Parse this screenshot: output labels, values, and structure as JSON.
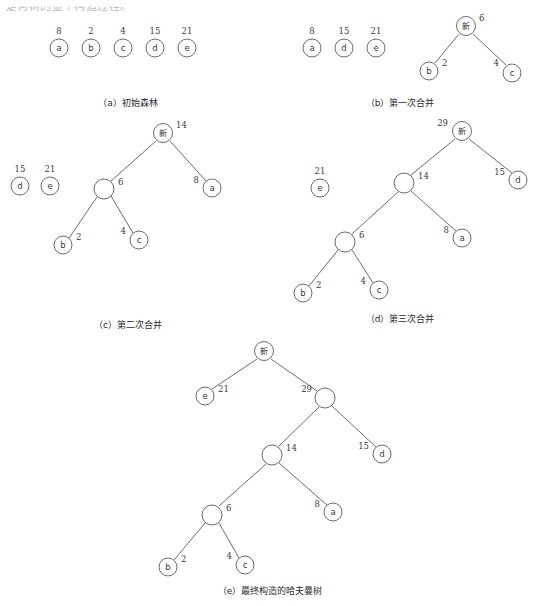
{
  "page": {
    "top_partial_text": "是何树的显个构造过程。",
    "width": 541,
    "height": 606,
    "background": "#ffffff",
    "ink_color": "#5a5a5a",
    "merge_node_label": "新"
  },
  "figure": {
    "type": "huffman-tree-construction",
    "leaf_weights": {
      "a": 8,
      "b": 2,
      "c": 4,
      "d": 15,
      "e": 21
    },
    "internal_weights": [
      6,
      14,
      29,
      50
    ]
  },
  "panels": [
    {
      "id": "a",
      "caption": "（a）初始森林",
      "caption_x": 128,
      "caption_y": 106,
      "nodes": [
        {
          "name": "a",
          "weight": "8",
          "cx": 59,
          "cy": 48,
          "r": 9,
          "is_merge": false,
          "wx": 59,
          "wy": 34,
          "w_anchor": "middle"
        },
        {
          "name": "b",
          "weight": "2",
          "cx": 91,
          "cy": 48,
          "r": 9,
          "is_merge": false,
          "wx": 91,
          "wy": 34,
          "w_anchor": "middle"
        },
        {
          "name": "c",
          "weight": "4",
          "cx": 123,
          "cy": 48,
          "r": 9,
          "is_merge": false,
          "wx": 123,
          "wy": 34,
          "w_anchor": "middle"
        },
        {
          "name": "d",
          "weight": "15",
          "cx": 155,
          "cy": 48,
          "r": 9,
          "is_merge": false,
          "wx": 155,
          "wy": 34,
          "w_anchor": "middle"
        },
        {
          "name": "e",
          "weight": "21",
          "cx": 187,
          "cy": 48,
          "r": 9,
          "is_merge": false,
          "wx": 187,
          "wy": 34,
          "w_anchor": "middle"
        }
      ],
      "edges": []
    },
    {
      "id": "b",
      "caption": "（b）第一次合并",
      "caption_x": 400,
      "caption_y": 106,
      "nodes": [
        {
          "name": "a",
          "weight": "8",
          "cx": 312,
          "cy": 48,
          "r": 9,
          "is_merge": false,
          "wx": 312,
          "wy": 34,
          "w_anchor": "middle"
        },
        {
          "name": "d",
          "weight": "15",
          "cx": 344,
          "cy": 48,
          "r": 9,
          "is_merge": false,
          "wx": 344,
          "wy": 34,
          "w_anchor": "middle"
        },
        {
          "name": "e",
          "weight": "21",
          "cx": 376,
          "cy": 48,
          "r": 9,
          "is_merge": false,
          "wx": 376,
          "wy": 34,
          "w_anchor": "middle"
        },
        {
          "name": "新",
          "weight": "6",
          "cx": 466,
          "cy": 26,
          "r": 9.5,
          "is_merge": true,
          "wx": 479,
          "wy": 21,
          "w_anchor": "start"
        },
        {
          "name": "b",
          "weight": "2",
          "cx": 429,
          "cy": 71,
          "r": 9,
          "is_merge": false,
          "wx": 442,
          "wy": 66,
          "w_anchor": "start"
        },
        {
          "name": "c",
          "weight": "4",
          "cx": 512,
          "cy": 73,
          "r": 9,
          "is_merge": false,
          "wx": 499,
          "wy": 66,
          "w_anchor": "end"
        }
      ],
      "edges": [
        {
          "x1": 459,
          "y1": 34,
          "x2": 435,
          "y2": 63
        },
        {
          "x1": 473,
          "y1": 34,
          "x2": 506,
          "y2": 65
        }
      ]
    },
    {
      "id": "c",
      "caption": "（c）第二次合并",
      "caption_x": 128,
      "caption_y": 328,
      "nodes": [
        {
          "name": "d",
          "weight": "15",
          "cx": 20,
          "cy": 186,
          "r": 9,
          "is_merge": false,
          "wx": 20,
          "wy": 172,
          "w_anchor": "middle"
        },
        {
          "name": "e",
          "weight": "21",
          "cx": 50,
          "cy": 186,
          "r": 9,
          "is_merge": false,
          "wx": 50,
          "wy": 172,
          "w_anchor": "middle"
        },
        {
          "name": "新",
          "weight": "14",
          "cx": 163,
          "cy": 133,
          "r": 9.5,
          "is_merge": true,
          "wx": 176,
          "wy": 128,
          "w_anchor": "start"
        },
        {
          "name": "",
          "weight": "6",
          "cx": 104,
          "cy": 189,
          "r": 10,
          "is_merge": false,
          "wx": 118,
          "wy": 185,
          "w_anchor": "start"
        },
        {
          "name": "a",
          "weight": "8",
          "cx": 212,
          "cy": 188,
          "r": 9,
          "is_merge": false,
          "wx": 199,
          "wy": 183,
          "w_anchor": "end"
        },
        {
          "name": "b",
          "weight": "2",
          "cx": 63,
          "cy": 245,
          "r": 9,
          "is_merge": false,
          "wx": 76,
          "wy": 240,
          "w_anchor": "start"
        },
        {
          "name": "c",
          "weight": "4",
          "cx": 139,
          "cy": 240,
          "r": 9,
          "is_merge": false,
          "wx": 126,
          "wy": 234,
          "w_anchor": "end"
        }
      ],
      "edges": [
        {
          "x1": 156,
          "y1": 141,
          "x2": 111,
          "y2": 181
        },
        {
          "x1": 170,
          "y1": 141,
          "x2": 206,
          "y2": 181
        },
        {
          "x1": 97,
          "y1": 197,
          "x2": 69,
          "y2": 238
        },
        {
          "x1": 111,
          "y1": 196,
          "x2": 133,
          "y2": 233
        }
      ]
    },
    {
      "id": "d",
      "caption": "（d）第三次合并",
      "caption_x": 400,
      "caption_y": 322,
      "nodes": [
        {
          "name": "e",
          "weight": "21",
          "cx": 320,
          "cy": 188,
          "r": 9,
          "is_merge": false,
          "wx": 320,
          "wy": 174,
          "w_anchor": "middle"
        },
        {
          "name": "新",
          "weight": "29",
          "cx": 462,
          "cy": 131,
          "r": 9.5,
          "is_merge": true,
          "wx": 448,
          "wy": 126,
          "w_anchor": "end"
        },
        {
          "name": "",
          "weight": "14",
          "cx": 404,
          "cy": 183,
          "r": 10,
          "is_merge": false,
          "wx": 418,
          "wy": 179,
          "w_anchor": "start"
        },
        {
          "name": "d",
          "weight": "15",
          "cx": 518,
          "cy": 180,
          "r": 9,
          "is_merge": false,
          "wx": 505,
          "wy": 175,
          "w_anchor": "end"
        },
        {
          "name": "",
          "weight": "6",
          "cx": 345,
          "cy": 242,
          "r": 10,
          "is_merge": false,
          "wx": 359,
          "wy": 238,
          "w_anchor": "start"
        },
        {
          "name": "a",
          "weight": "8",
          "cx": 462,
          "cy": 238,
          "r": 9,
          "is_merge": false,
          "wx": 449,
          "wy": 233,
          "w_anchor": "end"
        },
        {
          "name": "b",
          "weight": "2",
          "cx": 303,
          "cy": 293,
          "r": 9,
          "is_merge": false,
          "wx": 316,
          "wy": 288,
          "w_anchor": "start"
        },
        {
          "name": "c",
          "weight": "4",
          "cx": 379,
          "cy": 290,
          "r": 9,
          "is_merge": false,
          "wx": 366,
          "wy": 284,
          "w_anchor": "end"
        }
      ],
      "edges": [
        {
          "x1": 455,
          "y1": 139,
          "x2": 411,
          "y2": 175
        },
        {
          "x1": 469,
          "y1": 139,
          "x2": 512,
          "y2": 173
        },
        {
          "x1": 398,
          "y1": 192,
          "x2": 352,
          "y2": 234
        },
        {
          "x1": 411,
          "y1": 191,
          "x2": 456,
          "y2": 231
        },
        {
          "x1": 338,
          "y1": 250,
          "x2": 309,
          "y2": 286
        },
        {
          "x1": 352,
          "y1": 250,
          "x2": 373,
          "y2": 283
        }
      ]
    },
    {
      "id": "e",
      "caption": "（e）最终构造的哈夫曼树",
      "caption_x": 270,
      "caption_y": 594,
      "nodes": [
        {
          "name": "新",
          "weight": "",
          "cx": 264,
          "cy": 351,
          "r": 9.5,
          "is_merge": true,
          "wx": 264,
          "wy": 351,
          "w_anchor": "middle"
        },
        {
          "name": "e",
          "weight": "21",
          "cx": 205,
          "cy": 396,
          "r": 9,
          "is_merge": false,
          "wx": 218,
          "wy": 392,
          "w_anchor": "start"
        },
        {
          "name": "",
          "weight": "29",
          "cx": 325,
          "cy": 398,
          "r": 10,
          "is_merge": false,
          "wx": 312,
          "wy": 392,
          "w_anchor": "end"
        },
        {
          "name": "",
          "weight": "14",
          "cx": 272,
          "cy": 455,
          "r": 10,
          "is_merge": false,
          "wx": 286,
          "wy": 451,
          "w_anchor": "start"
        },
        {
          "name": "d",
          "weight": "15",
          "cx": 382,
          "cy": 454,
          "r": 9,
          "is_merge": false,
          "wx": 369,
          "wy": 449,
          "w_anchor": "end"
        },
        {
          "name": "",
          "weight": "6",
          "cx": 212,
          "cy": 515,
          "r": 10,
          "is_merge": false,
          "wx": 226,
          "wy": 511,
          "w_anchor": "start"
        },
        {
          "name": "a",
          "weight": "8",
          "cx": 333,
          "cy": 512,
          "r": 9,
          "is_merge": false,
          "wx": 320,
          "wy": 507,
          "w_anchor": "end"
        },
        {
          "name": "b",
          "weight": "2",
          "cx": 168,
          "cy": 567,
          "r": 9,
          "is_merge": false,
          "wx": 181,
          "wy": 562,
          "w_anchor": "start"
        },
        {
          "name": "c",
          "weight": "4",
          "cx": 245,
          "cy": 565,
          "r": 9,
          "is_merge": false,
          "wx": 232,
          "wy": 559,
          "w_anchor": "end"
        }
      ],
      "edges": [
        {
          "x1": 257,
          "y1": 359,
          "x2": 212,
          "y2": 389
        },
        {
          "x1": 271,
          "y1": 359,
          "x2": 317,
          "y2": 391
        },
        {
          "x1": 319,
          "y1": 407,
          "x2": 279,
          "y2": 446
        },
        {
          "x1": 332,
          "y1": 406,
          "x2": 376,
          "y2": 447
        },
        {
          "x1": 266,
          "y1": 464,
          "x2": 219,
          "y2": 506
        },
        {
          "x1": 279,
          "y1": 463,
          "x2": 327,
          "y2": 505
        },
        {
          "x1": 205,
          "y1": 523,
          "x2": 174,
          "y2": 560
        },
        {
          "x1": 219,
          "y1": 523,
          "x2": 239,
          "y2": 558
        }
      ]
    }
  ]
}
